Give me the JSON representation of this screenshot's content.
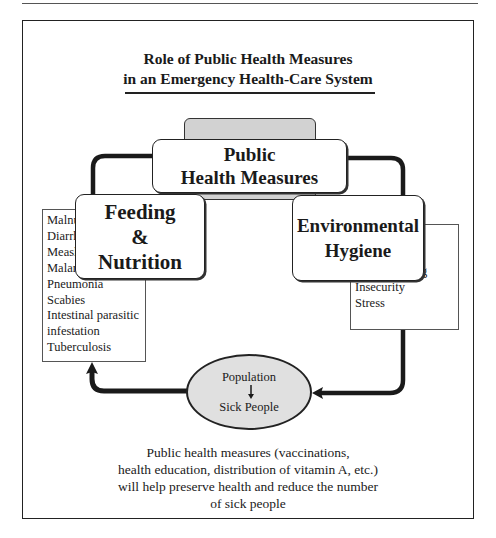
{
  "title": {
    "line1": "Role of Public Health Measures",
    "line2": "in an Emergency Health-Care System"
  },
  "nodes": {
    "public_health": {
      "line1": "Public",
      "line2": "Health Measures"
    },
    "feeding": {
      "line1": "Feeding",
      "line2": "&",
      "line3": "Nutrition"
    },
    "environmental": {
      "line1": "Environmental",
      "line2": "Hygiene"
    },
    "population": {
      "top": "Population",
      "bottom": "Sick People",
      "arrow_icon": "down-arrow"
    }
  },
  "left_list": {
    "items": [
      "Malnutrition",
      "Diarrhoea",
      "Measles",
      "Malaria",
      "Pneumonia",
      "Scabies",
      "Intestinal parasitic",
      "infestation",
      "Tuberculosis"
    ]
  },
  "right_list": {
    "items": [
      "Water",
      "Food",
      "Overcrowding",
      "Insecurity",
      "Stress"
    ]
  },
  "caption": {
    "line1": "Public health measures (vaccinations,",
    "line2": "health education, distribution of vitamin A, etc.)",
    "line3": "will help preserve health and reduce the number",
    "line4": "of sick people"
  },
  "colors": {
    "line": "#1a1a1a",
    "gray_fill": "#d2d2d2",
    "ellipse_fill": "#e0e0e0"
  }
}
